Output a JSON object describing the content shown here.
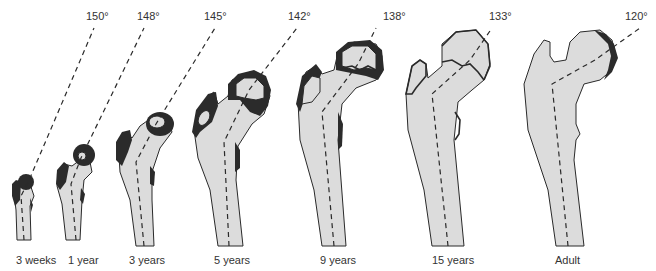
{
  "figure": {
    "stages": [
      {
        "age": "3 weeks",
        "angle": "150°",
        "angle_value": 150
      },
      {
        "age": "1 year",
        "angle": "148°",
        "angle_value": 148
      },
      {
        "age": "3 years",
        "angle": "145°",
        "angle_value": 145
      },
      {
        "age": "5 years",
        "angle": "142°",
        "angle_value": 142
      },
      {
        "age": "9 years",
        "angle": "138°",
        "angle_value": 138
      },
      {
        "age": "15 years",
        "angle": "133°",
        "angle_value": 133
      },
      {
        "age": "Adult",
        "angle": "120°",
        "angle_value": 120
      }
    ]
  }
}
